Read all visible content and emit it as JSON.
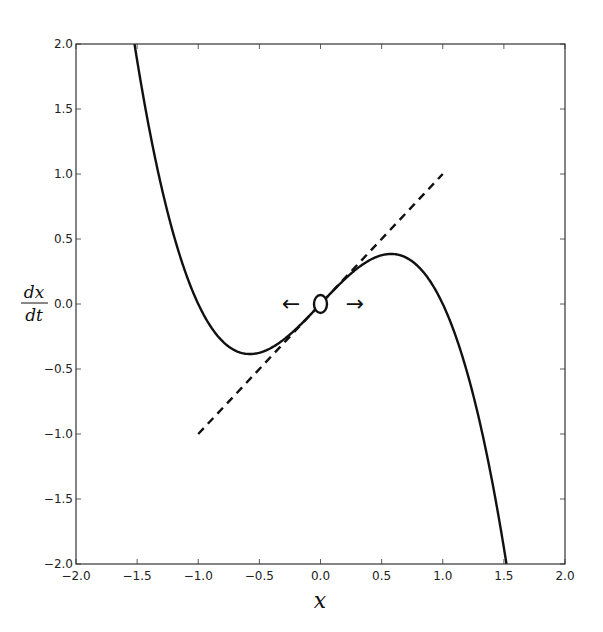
{
  "chart_data": {
    "type": "line",
    "title": "",
    "xlabel": "x",
    "ylabel": "dx/dt",
    "ylabel_num": "dx",
    "ylabel_den": "dt",
    "xlim": [
      -2.0,
      2.0
    ],
    "ylim": [
      -2.0,
      2.0
    ],
    "grid": false,
    "xticks": [
      "-2.0",
      "-1.5",
      "-1.0",
      "-0.5",
      "0.0",
      "0.5",
      "1.0",
      "1.5",
      "2.0"
    ],
    "yticks": [
      "2.0",
      "1.5",
      "1.0",
      "0.5",
      "0.0",
      "-0.5",
      "-1.0",
      "-1.5",
      "-2.0"
    ],
    "series": [
      {
        "name": "dx/dt = x - x^3",
        "style": "solid",
        "color": "#111111",
        "function": "x - x^3",
        "x": [
          -1.52,
          -1.4,
          -1.2,
          -1.0,
          -0.8,
          -0.6,
          -0.4,
          -0.2,
          0.0,
          0.2,
          0.4,
          0.6,
          0.8,
          1.0,
          1.2,
          1.4,
          1.52
        ],
        "y": [
          1.99,
          1.344,
          0.528,
          0.0,
          -0.288,
          -0.384,
          -0.336,
          -0.192,
          0.0,
          0.192,
          0.336,
          0.384,
          0.288,
          0.0,
          -0.528,
          -1.344,
          -1.99
        ]
      },
      {
        "name": "linearization dx/dt = x",
        "style": "dashed",
        "color": "#111111",
        "x": [
          -1.0,
          1.0
        ],
        "y": [
          -1.0,
          1.0
        ]
      }
    ],
    "annotations": [
      {
        "type": "open-circle",
        "x": 0.0,
        "y": 0.0,
        "label": "unstable fixed point"
      },
      {
        "type": "arrow",
        "direction": "left",
        "x": -0.12,
        "y": 0.0,
        "glyph": "←"
      },
      {
        "type": "arrow",
        "direction": "right",
        "x": 0.12,
        "y": 0.0,
        "glyph": "→"
      }
    ]
  },
  "axes": {
    "xlabel": "x",
    "ylabel_num": "dx",
    "ylabel_den": "dt"
  },
  "arrows": {
    "left": "←",
    "right": "→"
  }
}
